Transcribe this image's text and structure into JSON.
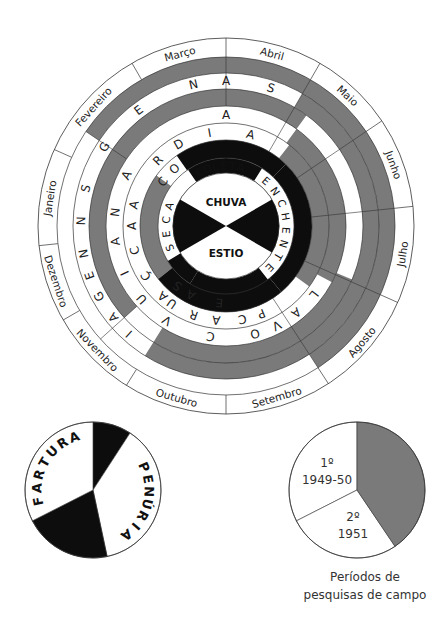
{
  "colors": {
    "gray": "#7a7a7a",
    "black": "#0d0d0d",
    "white": "#ffffff",
    "line": "#333333"
  },
  "main_wheel": {
    "center": [
      226,
      226
    ],
    "month_ring": {
      "r_inner": 169,
      "r_outer": 188,
      "months": [
        {
          "label": "Abril",
          "start": 0,
          "end": 30
        },
        {
          "label": "Maio",
          "start": 30,
          "end": 56
        },
        {
          "label": "Junho",
          "start": 56,
          "end": 84
        },
        {
          "label": "Julho",
          "start": 84,
          "end": 114
        },
        {
          "label": "Agosto",
          "start": 114,
          "end": 147
        },
        {
          "label": "Setembro",
          "start": 147,
          "end": 180
        },
        {
          "label": "Outubro",
          "start": 180,
          "end": 212
        },
        {
          "label": "Novembro",
          "start": 212,
          "end": 240
        },
        {
          "label": "Dezembro",
          "start": 240,
          "end": 264
        },
        {
          "label": "Janeiro",
          "start": 264,
          "end": 294
        },
        {
          "label": "Fevereiro",
          "start": 294,
          "end": 330
        },
        {
          "label": "Março",
          "start": 330,
          "end": 360
        }
      ]
    },
    "rings": [
      {
        "name": "ring-outer-gray",
        "r_inner": 153,
        "r_outer": 169,
        "gray": [
          [
            304,
            360
          ],
          [
            0,
            147
          ]
        ]
      },
      {
        "name": "ring-pesca-ensagens",
        "r_inner": 137,
        "r_outer": 153,
        "gray": [
          [
            30,
            212
          ]
        ],
        "letters_label": "PESCA / ENSAGENS",
        "letters": [
          {
            "ch": "S",
            "a": 18
          },
          {
            "ch": "N",
            "a": 347
          },
          {
            "ch": "E",
            "a": 323
          },
          {
            "ch": "G",
            "a": 303
          },
          {
            "ch": "S",
            "a": 285
          },
          {
            "ch": "N",
            "a": 272
          },
          {
            "ch": "N",
            "a": 259
          },
          {
            "ch": "E",
            "a": 250
          },
          {
            "ch": "G",
            "a": 241
          },
          {
            "ch": "A",
            "a": 231
          },
          {
            "ch": "I",
            "a": 222
          },
          {
            "ch": "A",
            "a": 0
          }
        ]
      },
      {
        "name": "ring-gray-mid",
        "r_inner": 120,
        "r_outer": 137,
        "gray": [
          [
            228,
            360
          ],
          [
            0,
            36
          ],
          [
            113,
            212
          ]
        ]
      },
      {
        "name": "ring-cacada",
        "r_inner": 103,
        "r_outer": 120,
        "gray": [
          [
            36,
            118
          ]
        ],
        "letters": [
          {
            "ch": "A",
            "a": 0
          },
          {
            "ch": "A",
            "a": 297
          },
          {
            "ch": "N",
            "a": 277
          },
          {
            "ch": "A",
            "a": 262
          },
          {
            "ch": "I",
            "a": 245
          },
          {
            "ch": "U",
            "a": 229
          },
          {
            "ch": "V",
            "a": 212
          },
          {
            "ch": "C",
            "a": 188
          },
          {
            "ch": "O",
            "a": 165
          },
          {
            "ch": "V",
            "a": 153
          },
          {
            "ch": "A",
            "a": 141
          },
          {
            "ch": "L",
            "a": 128
          }
        ]
      },
      {
        "name": "ring-ardia",
        "r_inner": 86,
        "r_outer": 103,
        "gray": [
          [
            38,
            126
          ]
        ],
        "letters": [
          {
            "ch": "A",
            "a": 15
          },
          {
            "ch": "I",
            "a": 350
          },
          {
            "ch": "D",
            "a": 330
          },
          {
            "ch": "R",
            "a": 314
          },
          {
            "ch": "A",
            "a": 283
          },
          {
            "ch": "A",
            "a": 270
          },
          {
            "ch": "C",
            "a": 255
          },
          {
            "ch": "Ç",
            "a": 238
          },
          {
            "ch": "U",
            "a": 215
          },
          {
            "ch": "R",
            "a": 200
          },
          {
            "ch": "A",
            "a": 222
          },
          {
            "ch": "C",
            "a": 170
          },
          {
            "ch": "A",
            "a": 186
          },
          {
            "ch": "P",
            "a": 158
          }
        ]
      },
      {
        "name": "ring-black",
        "r_inner": 68,
        "r_outer": 86,
        "gray": [
          [
            232,
            306
          ]
        ],
        "black": [
          [
            325,
            360
          ],
          [
            0,
            44
          ],
          [
            44,
            140
          ],
          [
            140,
            232
          ]
        ],
        "letters": [
          {
            "ch": "E",
            "a": 185
          },
          {
            "ch": "A",
            "a": 207
          },
          {
            "ch": "S",
            "a": 219
          },
          {
            "ch": "O",
            "a": 318
          },
          {
            "ch": "C",
            "a": 305
          }
        ]
      },
      {
        "name": "ring-seasons",
        "r_inner": 53,
        "r_outer": 68,
        "black": [
          [
            326,
            360
          ],
          [
            0,
            32
          ],
          [
            212,
            239
          ]
        ],
        "labels": [
          {
            "text": "COLETA",
            "a_start": 330,
            "a_end": 18
          },
          {
            "text": "ENCHENTE",
            "a_start": 35,
            "a_end": 140
          },
          {
            "text": "SECA",
            "a_start": 242,
            "a_end": 296
          }
        ]
      }
    ],
    "center_disc": {
      "r": 53,
      "bowtie_black": [
        [
          60,
          120
        ],
        [
          240,
          300
        ]
      ],
      "top_label": "CHUVA",
      "bottom_label": "ESTIO"
    },
    "extra_black": [
      {
        "r_inner": 53,
        "r_outer": 86,
        "arc": [
          142,
          212
        ]
      }
    ]
  },
  "pie_fartura_penuria": {
    "center": [
      93,
      490
    ],
    "r": 68,
    "segments": [
      {
        "start": 0,
        "end": 33,
        "fill": "black"
      },
      {
        "start": 33,
        "end": 168,
        "fill": "white",
        "label": "PENÚRIA"
      },
      {
        "start": 168,
        "end": 243,
        "fill": "black"
      },
      {
        "start": 243,
        "end": 360,
        "fill": "white",
        "label": "FARTURA"
      }
    ],
    "labels": {
      "fartura": "FARTURA",
      "penuria": "PENÚRIA"
    }
  },
  "pie_periodos": {
    "center": [
      357,
      490
    ],
    "r": 68,
    "segments": [
      {
        "start": 0,
        "end": 146,
        "fill": "gray"
      },
      {
        "start": 146,
        "end": 243,
        "fill": "white",
        "label": "2º\n1951"
      },
      {
        "start": 243,
        "end": 360,
        "fill": "white",
        "label": "1º\n1949-50"
      }
    ],
    "labels": {
      "first_ordinal": "1º",
      "first_years": "1949-50",
      "second_ordinal": "2º",
      "second_years": "1951"
    },
    "caption_line1": "Períodos de",
    "caption_line2": "pesquisas de campo"
  }
}
